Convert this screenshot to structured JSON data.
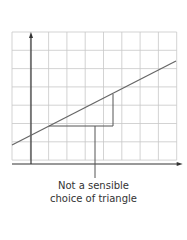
{
  "diagram": {
    "grid": {
      "x0": 12,
      "y0": 32,
      "cols": 9,
      "rows": 7,
      "cell": 18.3,
      "color": "#c8c8c8"
    },
    "axes": {
      "origin_x": 31,
      "origin_y": 164,
      "color": "#333333"
    },
    "line": {
      "x1": 12,
      "y1": 145,
      "x2": 176,
      "y2": 61,
      "color": "#666666"
    },
    "triangle": {
      "base_y": 126,
      "base_x1": 49,
      "base_x2": 113,
      "rise_top_y": 94
    },
    "pointer": {
      "x": 95,
      "y1": 126,
      "y2": 178
    },
    "caption_line1": "Not a sensible",
    "caption_line2": "choice of triangle"
  }
}
